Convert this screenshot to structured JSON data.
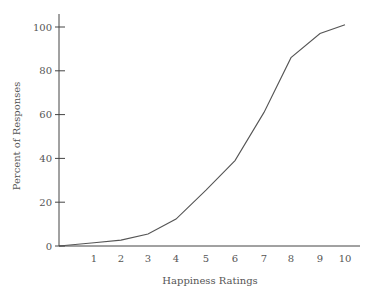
{
  "chart_data": {
    "type": "line",
    "title": "",
    "xlabel": "Happiness Ratings",
    "ylabel": "Percent of Responses",
    "x": [
      0,
      1,
      2,
      3,
      4,
      5,
      6,
      7,
      8,
      9,
      10
    ],
    "values": [
      0,
      1.5,
      2.7,
      5.5,
      12.3,
      25.5,
      39,
      61,
      86,
      97,
      101
    ],
    "x_tick_labels": [
      "1",
      "2",
      "3",
      "4",
      "5",
      "6",
      "7",
      "8",
      "9",
      "10"
    ],
    "y_tick_labels": [
      "0",
      "20",
      "40",
      "60",
      "80",
      "100"
    ],
    "y_ticks": [
      0,
      20,
      40,
      60,
      80,
      100
    ],
    "xlim": [
      0,
      10
    ],
    "ylim": [
      0,
      105
    ],
    "grid": false,
    "legend": null,
    "line_color": "#555555"
  },
  "labels": {
    "xlabel": "Happiness Ratings",
    "ylabel": "Percent of Responses"
  }
}
